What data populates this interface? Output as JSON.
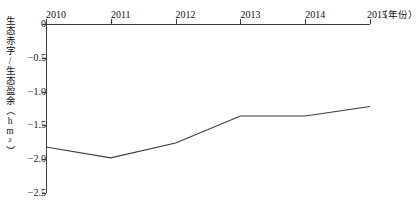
{
  "chart_data": {
    "type": "line",
    "title": "",
    "subtitle": "",
    "xlabel": "（年份）",
    "ylabel": "生态赤字/生态盈余（hm²）",
    "ylabel_text": "生态赤字/生态盈余",
    "ylabel_unit": "（hm²）",
    "categories": [
      "2010",
      "2011",
      "2012",
      "2013",
      "2014",
      "2015"
    ],
    "x": [
      2010,
      2011,
      2012,
      2013,
      2014,
      2015
    ],
    "values": [
      -1.82,
      -1.98,
      -1.76,
      -1.36,
      -1.36,
      -1.22
    ],
    "series": [
      {
        "name": "生态赤字/生态盈余",
        "values": [
          -1.82,
          -1.98,
          -1.76,
          -1.36,
          -1.36,
          -1.22
        ]
      }
    ],
    "ylim": [
      -2.5,
      0
    ],
    "xlim": [
      2010,
      2015
    ],
    "yticks": [
      0,
      -0.5,
      -1.0,
      -1.5,
      -2.0,
      -2.5
    ],
    "ytick_labels": [
      "0",
      "−0.5",
      "−1.0",
      "−1.5",
      "−2.0",
      "−2.5"
    ],
    "xticks": [
      2010,
      2011,
      2012,
      2013,
      2014,
      2015
    ],
    "xtick_labels": [
      "2010",
      "2011",
      "2012",
      "2013",
      "2014",
      "2015"
    ],
    "grid": false,
    "legend": false,
    "legend_position": "none",
    "x_axis_position": "top",
    "line_color": "#3c3c3c",
    "markers": false,
    "annotations": []
  },
  "colors": {
    "line": "#3c3c3c",
    "axis": "#3c3c3c",
    "text": "#111111",
    "background": "#ffffff"
  }
}
